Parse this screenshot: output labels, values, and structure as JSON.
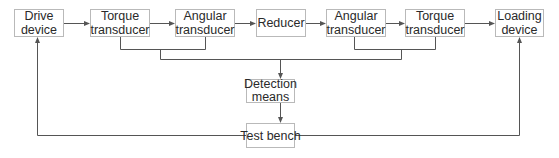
{
  "diagram": {
    "nodes": {
      "drive_device": {
        "line1": "Drive",
        "line2": "device"
      },
      "torque_transducer_1": {
        "line1": "Torque",
        "line2": "transducer"
      },
      "angular_transducer_1": {
        "line1": "Angular",
        "line2": "transducer"
      },
      "reducer": {
        "line1": "Reducer"
      },
      "angular_transducer_2": {
        "line1": "Angular",
        "line2": "transducer"
      },
      "torque_transducer_2": {
        "line1": "Torque",
        "line2": "transducer"
      },
      "loading_device": {
        "line1": "Loading",
        "line2": "device"
      },
      "detection_means": {
        "line1": "Detection",
        "line2": "means"
      },
      "test_bench": {
        "line1": "Test bench"
      }
    },
    "edges": [
      {
        "from": "Drive device",
        "to": "Torque transducer"
      },
      {
        "from": "Torque transducer",
        "to": "Angular transducer"
      },
      {
        "from": "Angular transducer",
        "to": "Reducer"
      },
      {
        "from": "Reducer",
        "to": "Angular transducer"
      },
      {
        "from": "Angular transducer",
        "to": "Torque transducer"
      },
      {
        "from": "Torque transducer",
        "to": "Loading device"
      },
      {
        "from": "Torque/Angular transducers (both sides)",
        "to": "Detection means"
      },
      {
        "from": "Detection means",
        "to": "Test bench"
      },
      {
        "from": "Test bench",
        "to": "Drive device"
      },
      {
        "from": "Test bench",
        "to": "Loading device"
      }
    ],
    "colors": {
      "line": "#555555",
      "box_border": "#b9b9b9",
      "text": "#2a2a2a"
    }
  }
}
